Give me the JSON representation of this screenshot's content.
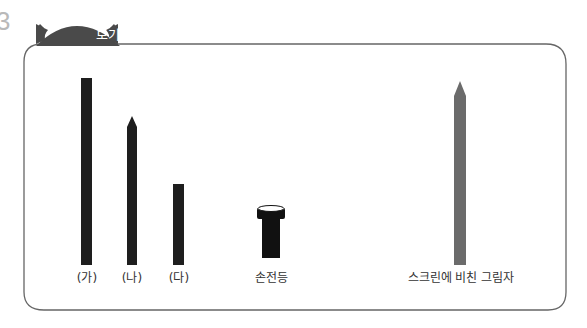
{
  "question_number_fragment": "3",
  "box": {
    "title": "보기",
    "title_bg": "#4a4a4a",
    "border_color": "#666666"
  },
  "objects": [
    {
      "id": "ga",
      "label": "(가)",
      "shape": "flat-top bar",
      "color": "#1e1e1e"
    },
    {
      "id": "na",
      "label": "(나)",
      "shape": "pointed-top bar",
      "color": "#1e1e1e"
    },
    {
      "id": "da",
      "label": "(다)",
      "shape": "flat-top bar",
      "color": "#1e1e1e"
    },
    {
      "id": "flashlight",
      "label": "손전등",
      "shape": "flashlight",
      "color": "#111111"
    },
    {
      "id": "shadow",
      "label": "스크린에 비친 그림자",
      "shape": "pointed-top bar",
      "color": "#6b6b6b"
    }
  ]
}
